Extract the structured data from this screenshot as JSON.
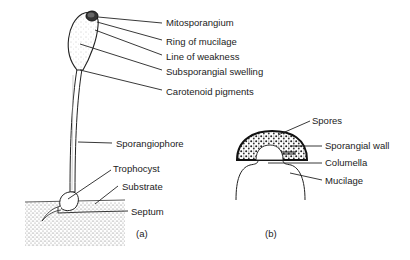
{
  "figure_a": {
    "panel_label": "(a)",
    "labels": {
      "mitosporangium": "Mitosporangium",
      "ring_of_mucilage": "Ring of mucilage",
      "line_of_weakness": "Line of weakness",
      "subsporangial_swelling": "Subsporangial swelling",
      "carotenoid_pigments": "Carotenoid pigments",
      "sporangiophore": "Sporangiophore",
      "trophocyst": "Trophocyst",
      "substrate": "Substrate",
      "septum": "Septum"
    }
  },
  "figure_b": {
    "panel_label": "(b)",
    "labels": {
      "spores": "Spores",
      "sporangial_wall": "Sporangial wall",
      "columella": "Columella",
      "mucilage": "Mucilage"
    }
  }
}
